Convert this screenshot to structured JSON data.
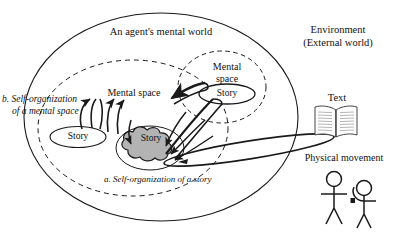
{
  "diagram": {
    "title_internal": "An agent's mental world",
    "environment": {
      "line1": "Environment",
      "line2": "(External world)",
      "text_label": "Text",
      "physical_movement_label": "Physical movement",
      "book_icon": "open-book-icon",
      "person_icons": [
        "stick-figure-icon",
        "stick-figure-icon"
      ]
    },
    "mental_spaces": [
      {
        "id": "left",
        "label_line1": "Mental space",
        "label_line2": "",
        "story_label": "Story"
      },
      {
        "id": "right",
        "label_line1": "Mental",
        "label_line2": "space",
        "story_label": "Story"
      }
    ],
    "central_story": {
      "label": "Story",
      "shape": "cloud-icon",
      "fill": "#b3b3b3"
    },
    "captions": {
      "a_marker": "a.",
      "a_text": "Self-organization of a story",
      "b_marker": "b.",
      "b_line1": "Self-organization",
      "b_line2": "of a mental space"
    },
    "colors": {
      "stroke": "#1a1a1a",
      "cloud_fill": "#b3b3b3",
      "background": "#ffffff"
    }
  }
}
